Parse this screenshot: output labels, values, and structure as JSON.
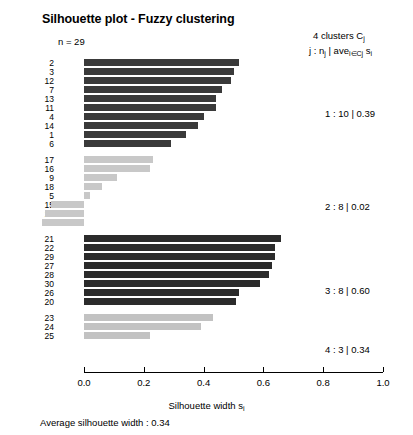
{
  "title": "Silhouette plot - Fuzzy clustering",
  "n_label": "n = 29",
  "legend": {
    "header_line1": "4  clusters  C",
    "header_line1_sub": "j",
    "header_line2_a": "j :  n",
    "header_line2_a_sub": "j",
    "header_line2_b": " | ave",
    "header_line2_b_sub": "i∈Cj",
    "header_line2_c": "  s",
    "header_line2_c_sub": "i",
    "entries": [
      {
        "label": "1 :  10  |  0.39",
        "top": 108
      },
      {
        "label": "2 :   8  |  0.02",
        "top": 201
      },
      {
        "label": "3 :   8  |  0.60",
        "top": 285
      },
      {
        "label": "4 :   3  |  0.34",
        "top": 344
      }
    ]
  },
  "axis": {
    "x_title_a": "Silhouette width  s",
    "x_title_sub": "i",
    "ticks": [
      "0.0",
      "0.2",
      "0.4",
      "0.6",
      "0.8",
      "1.0"
    ],
    "tick_values": [
      0.0,
      0.2,
      0.4,
      0.6,
      0.8,
      1.0
    ],
    "xlim": [
      -0.15,
      1.0
    ]
  },
  "footer": "Average silhouette width :  0.34",
  "colors": {
    "cluster1": "#3a3a3a",
    "cluster2": "#c8c8c8",
    "cluster3": "#2b2b2b",
    "cluster4": "#c2c2c2",
    "axis": "#000000",
    "background": "#ffffff"
  },
  "chart_data": {
    "type": "bar",
    "orientation": "horizontal",
    "title": "Silhouette plot - Fuzzy clustering",
    "xlabel": "Silhouette width s_i",
    "ylabel": "",
    "xlim": [
      -0.15,
      1.0
    ],
    "grid": false,
    "n": 29,
    "n_clusters": 4,
    "average_silhouette_width": 0.34,
    "clusters": [
      {
        "j": 1,
        "size": 10,
        "avg_silhouette": 0.39,
        "color": "#3a3a3a",
        "labels": [
          "2",
          "3",
          "12",
          "7",
          "13",
          "11",
          "4",
          "14",
          "1",
          "6"
        ],
        "values": [
          0.52,
          0.5,
          0.49,
          0.46,
          0.44,
          0.44,
          0.4,
          0.38,
          0.34,
          0.29
        ]
      },
      {
        "j": 2,
        "size": 8,
        "avg_silhouette": 0.02,
        "color": "#c8c8c8",
        "labels": [
          "17",
          "16",
          "9",
          "18",
          "5",
          "15",
          "10",
          "19"
        ],
        "values": [
          0.23,
          0.22,
          0.11,
          0.06,
          0.02,
          -0.11,
          -0.13,
          -0.14
        ]
      },
      {
        "j": 3,
        "size": 8,
        "avg_silhouette": 0.6,
        "color": "#2b2b2b",
        "labels": [
          "21",
          "22",
          "29",
          "27",
          "28",
          "30",
          "26",
          "20"
        ],
        "values": [
          0.66,
          0.64,
          0.64,
          0.63,
          0.62,
          0.59,
          0.52,
          0.51
        ]
      },
      {
        "j": 4,
        "size": 3,
        "avg_silhouette": 0.34,
        "color": "#c2c2c2",
        "labels": [
          "23",
          "24",
          "25"
        ],
        "values": [
          0.43,
          0.39,
          0.22
        ]
      }
    ]
  }
}
